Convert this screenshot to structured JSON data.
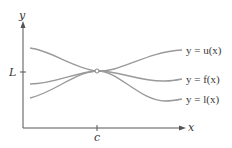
{
  "diagram": {
    "axes": {
      "x_label": "x",
      "y_label": "y",
      "x_tick_label": "c",
      "y_tick_label": "L"
    },
    "curves": [
      {
        "id": "u",
        "label": "y = u(x)",
        "role": "upper bound"
      },
      {
        "id": "f",
        "label": "y = f(x)",
        "role": "squeezed function"
      },
      {
        "id": "l",
        "label": "y = l(x)",
        "role": "lower bound"
      }
    ],
    "point": {
      "x": "c",
      "y": "L",
      "style": "open circle"
    },
    "colors": {
      "axis": "#555555",
      "curve": "#9a9a9a",
      "text": "#333333",
      "background": "#ffffff"
    }
  }
}
